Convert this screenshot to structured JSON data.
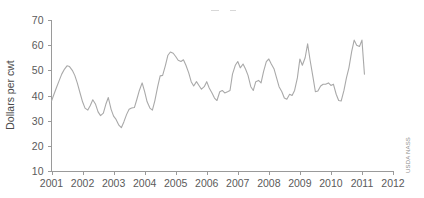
{
  "chart_data": {
    "type": "line",
    "title": "",
    "subtitle": "",
    "xlabel": "",
    "ylabel": "Dollars per cwt",
    "xlim": [
      2001,
      2012
    ],
    "ylim": [
      10,
      70
    ],
    "grid": false,
    "legend": null,
    "xticks": [
      "2001",
      "2002",
      "2003",
      "2004",
      "2005",
      "2006",
      "2007",
      "2008",
      "2009",
      "2010",
      "2011",
      "2012"
    ],
    "yticks": [
      "10",
      "20",
      "30",
      "40",
      "50",
      "60",
      "70"
    ],
    "source_credit": "USDA NASS",
    "series": [
      {
        "name": "Price",
        "x": [
          2001.0,
          2001.08,
          2001.17,
          2001.25,
          2001.33,
          2001.42,
          2001.5,
          2001.58,
          2001.67,
          2001.75,
          2001.83,
          2001.92,
          2002.0,
          2002.08,
          2002.17,
          2002.25,
          2002.33,
          2002.42,
          2002.5,
          2002.58,
          2002.67,
          2002.75,
          2002.83,
          2002.92,
          2003.0,
          2003.08,
          2003.17,
          2003.25,
          2003.33,
          2003.42,
          2003.5,
          2003.58,
          2003.67,
          2003.75,
          2003.83,
          2003.92,
          2004.0,
          2004.08,
          2004.17,
          2004.25,
          2004.33,
          2004.42,
          2004.5,
          2004.58,
          2004.67,
          2004.75,
          2004.83,
          2004.92,
          2005.0,
          2005.08,
          2005.17,
          2005.25,
          2005.33,
          2005.42,
          2005.5,
          2005.58,
          2005.67,
          2005.75,
          2005.83,
          2005.92,
          2006.0,
          2006.08,
          2006.17,
          2006.25,
          2006.33,
          2006.42,
          2006.5,
          2006.58,
          2006.67,
          2006.75,
          2006.83,
          2006.92,
          2007.0,
          2007.08,
          2007.17,
          2007.25,
          2007.33,
          2007.42,
          2007.5,
          2007.58,
          2007.67,
          2007.75,
          2007.83,
          2007.92,
          2008.0,
          2008.08,
          2008.17,
          2008.25,
          2008.33,
          2008.42,
          2008.5,
          2008.58,
          2008.67,
          2008.75,
          2008.83,
          2008.92,
          2009.0,
          2009.08,
          2009.17,
          2009.25,
          2009.33,
          2009.42,
          2009.5,
          2009.58,
          2009.67,
          2009.75,
          2009.83,
          2009.92,
          2010.0,
          2010.08,
          2010.17,
          2010.25,
          2010.33,
          2010.42,
          2010.5,
          2010.58,
          2010.67,
          2010.75,
          2010.83,
          2010.92,
          2011.0,
          2011.08
        ],
        "values": [
          37.8,
          40.5,
          43.5,
          46.0,
          48.5,
          50.5,
          51.8,
          51.5,
          50.0,
          48.0,
          45.0,
          41.0,
          37.5,
          35.0,
          34.2,
          36.0,
          38.3,
          36.5,
          33.5,
          32.0,
          33.0,
          36.5,
          39.2,
          34.5,
          31.8,
          30.5,
          28.2,
          27.2,
          29.5,
          32.5,
          34.5,
          35.0,
          35.2,
          38.5,
          42.0,
          45.0,
          41.5,
          37.5,
          35.0,
          34.2,
          38.0,
          43.5,
          47.8,
          48.0,
          52.0,
          56.0,
          57.3,
          56.8,
          55.5,
          54.0,
          53.5,
          54.2,
          52.0,
          49.0,
          45.5,
          43.8,
          45.5,
          44.0,
          42.5,
          43.5,
          45.5,
          43.0,
          41.0,
          39.0,
          38.0,
          41.5,
          42.0,
          41.0,
          41.5,
          42.0,
          48.5,
          52.0,
          53.5,
          51.0,
          52.5,
          50.5,
          48.0,
          43.5,
          42.0,
          45.5,
          46.0,
          45.0,
          49.5,
          53.5,
          54.5,
          52.5,
          50.5,
          47.0,
          43.5,
          41.5,
          39.0,
          38.5,
          40.5,
          40.0,
          42.0,
          47.0,
          54.5,
          52.0,
          55.0,
          60.5,
          54.0,
          47.5,
          41.5,
          41.8,
          43.8,
          44.5,
          44.5,
          45.0,
          44.0,
          44.5,
          40.5,
          38.0,
          37.8,
          42.0,
          47.0,
          51.0,
          57.5,
          62.0,
          60.0,
          59.5,
          62.0,
          48.5
        ]
      }
    ],
    "artifacts": [
      {
        "x": 211,
        "y": 10,
        "width": 8,
        "height": 1
      },
      {
        "x": 230,
        "y": 10,
        "width": 6,
        "height": 1
      }
    ]
  },
  "axes": {
    "y_title": "Dollars per cwt"
  }
}
